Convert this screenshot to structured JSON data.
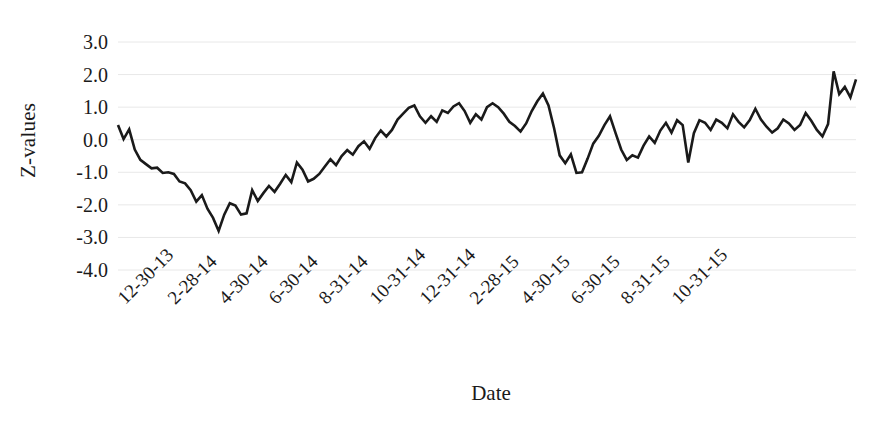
{
  "chart_data": {
    "type": "line",
    "title": "",
    "xlabel": "Date",
    "ylabel": "Z-values",
    "ylim": [
      -4.0,
      3.0
    ],
    "ytick_labels": [
      "3.0",
      "2.0",
      "1.0",
      "0.0",
      "-1.0",
      "-2.0",
      "-3.0",
      "-4.0"
    ],
    "ytick_values": [
      3.0,
      2.0,
      1.0,
      0.0,
      -1.0,
      -2.0,
      -3.0,
      -4.0
    ],
    "grid": true,
    "grid_color": "#e8e8e8",
    "legend": "none",
    "line_color": "#1a1a1a",
    "line_width": 2.6,
    "xtick_labels": [
      "12-30-13",
      "2-28-14",
      "4-30-14",
      "6-30-14",
      "8-31-14",
      "10-31-14",
      "12-31-14",
      "2-28-15",
      "4-30-15",
      "6-30-15",
      "8-31-15",
      "10-31-15"
    ],
    "xtick_index": [
      0,
      9,
      18,
      27,
      36,
      45,
      54,
      63,
      72,
      81,
      90,
      99
    ],
    "n_points": 107,
    "values": [
      0.45,
      0.02,
      0.32,
      -0.3,
      -0.62,
      -0.75,
      -0.88,
      -0.86,
      -1.02,
      -1.0,
      -1.05,
      -1.28,
      -1.34,
      -1.55,
      -1.9,
      -1.7,
      -2.12,
      -2.4,
      -2.8,
      -2.3,
      -1.95,
      -2.02,
      -2.3,
      -2.26,
      -1.55,
      -1.88,
      -1.64,
      -1.42,
      -1.6,
      -1.35,
      -1.08,
      -1.3,
      -0.7,
      -0.92,
      -1.28,
      -1.2,
      -1.05,
      -0.82,
      -0.6,
      -0.78,
      -0.5,
      -0.32,
      -0.46,
      -0.2,
      -0.05,
      -0.28,
      0.05,
      0.28,
      0.1,
      0.3,
      0.62,
      0.8,
      0.98,
      1.05,
      0.72,
      0.52,
      0.72,
      0.55,
      0.9,
      0.82,
      1.02,
      1.12,
      0.88,
      0.52,
      0.78,
      0.62,
      1.0,
      1.12,
      1.0,
      0.8,
      0.55,
      0.42,
      0.25,
      0.5,
      0.88,
      1.18,
      1.42,
      1.05,
      0.35,
      -0.48,
      -0.72,
      -0.45,
      -1.02,
      -1.0,
      -0.58,
      -0.12,
      0.12,
      0.45,
      0.72,
      0.2,
      -0.3,
      -0.62,
      -0.48,
      -0.55,
      -0.18,
      0.1,
      -0.1,
      0.28,
      0.52,
      0.22,
      0.6,
      0.45,
      -0.7,
      0.2,
      0.6,
      0.52,
      0.3,
      0.62,
      0.52,
      0.35,
      0.78,
      0.55,
      0.38,
      0.6,
      0.95,
      0.62,
      0.4,
      0.22,
      0.35,
      0.62,
      0.5,
      0.3,
      0.45,
      0.82,
      0.58,
      0.3,
      0.1,
      0.48,
      2.1,
      1.4,
      1.62,
      1.3,
      1.85
    ]
  },
  "plot_geometry": {
    "left": 118,
    "right": 856,
    "top_value": 3.0,
    "bottom_value": -4.0,
    "top_px": 42,
    "bottom_px": 270
  }
}
